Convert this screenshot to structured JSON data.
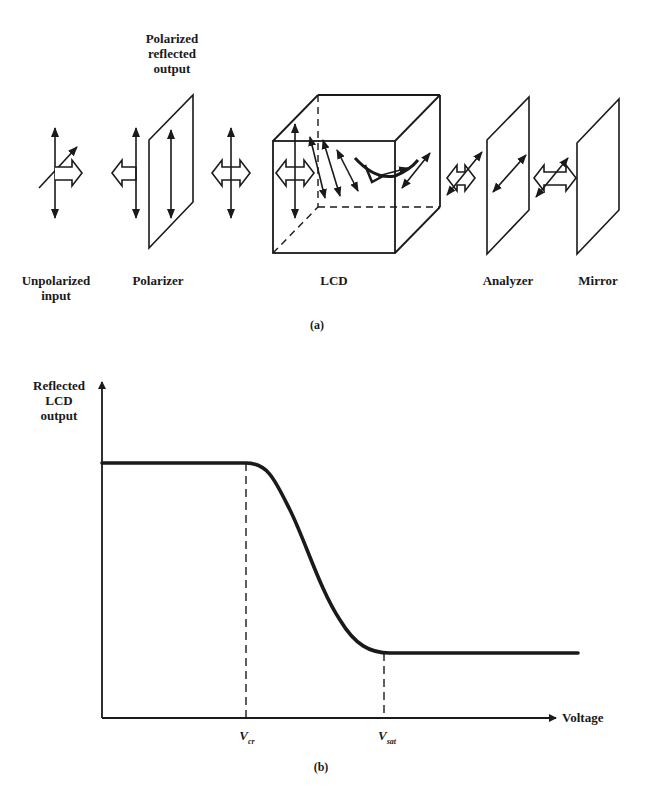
{
  "diagram_a": {
    "caption": "(a)",
    "top_label": [
      "Polarized",
      "reflected",
      "output"
    ],
    "components": [
      {
        "id": "input",
        "label": [
          "Unpolarized",
          "input"
        ]
      },
      {
        "id": "polarizer",
        "label": [
          "Polarizer"
        ]
      },
      {
        "id": "lcd",
        "label": [
          "LCD"
        ]
      },
      {
        "id": "analyzer",
        "label": [
          "Analyzer"
        ]
      },
      {
        "id": "mirror",
        "label": [
          "Mirror"
        ]
      }
    ]
  },
  "chart_data": {
    "type": "line",
    "title": "",
    "caption": "(b)",
    "xlabel": "Voltage",
    "ylabel": "Reflected LCD output",
    "x_ticks": [
      "Vcr",
      "Vsat"
    ],
    "grid": false,
    "series": [
      {
        "name": "Reflected LCD output",
        "x": [
          0,
          0.25,
          0.5,
          0.75,
          1.0,
          1.25,
          1.5,
          1.75,
          2.0,
          2.5,
          3.0
        ],
        "y": [
          1.0,
          1.0,
          1.0,
          1.0,
          1.0,
          0.8,
          0.5,
          0.2,
          0.0,
          0.0,
          0.0
        ],
        "x_note": "x in units where Vcr = 1.0 and Vsat = 2.0; y normalized (high plateau = 1, low plateau = 0)"
      }
    ],
    "annotations": [
      {
        "type": "vline",
        "label": "Vcr",
        "style": "dashed"
      },
      {
        "type": "vline",
        "label": "Vsat",
        "style": "dashed"
      }
    ],
    "x_label_sub": {
      "Vcr": "cr",
      "Vsat": "sat"
    },
    "v_main": "V"
  }
}
